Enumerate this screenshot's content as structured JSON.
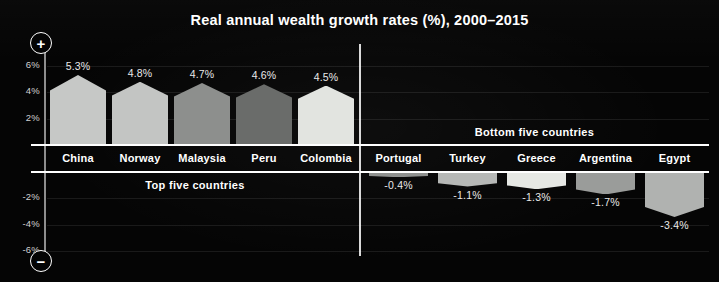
{
  "title": "Real annual wealth growth rates (%), 2000–2015",
  "axis": {
    "plus_icon_label": "+",
    "minus_icon_label": "−",
    "ticks": [
      {
        "label": "6%",
        "value": 6
      },
      {
        "label": "4%",
        "value": 4
      },
      {
        "label": "2%",
        "value": 2
      },
      {
        "label": "-2%",
        "value": -2
      },
      {
        "label": "-4%",
        "value": -4
      },
      {
        "label": "-6%",
        "value": -6
      }
    ]
  },
  "sections": {
    "top_label": "Top five countries",
    "bottom_label": "Bottom five countries"
  },
  "chart_data": {
    "type": "bar",
    "title": "Real annual wealth growth rates (%), 2000–2015",
    "xlabel": "",
    "ylabel": "",
    "ylim": [
      -7,
      7
    ],
    "grid": true,
    "legend": "none",
    "orientation": "vertical",
    "note": "Two panels: five fastest-growing (left, positive) and five fastest-shrinking (right, negative) countries.",
    "panels": [
      {
        "name": "Top five countries",
        "categories": [
          "China",
          "Norway",
          "Malaysia",
          "Peru",
          "Colombia"
        ],
        "values": [
          5.3,
          4.8,
          4.7,
          4.6,
          4.5
        ],
        "value_labels": [
          "5.3%",
          "4.8%",
          "4.7%",
          "4.6%",
          "4.5%"
        ],
        "colors": [
          "#c6c8c6",
          "#c3c5c3",
          "#8d8f8d",
          "#6a6c6a",
          "#e2e4e0"
        ]
      },
      {
        "name": "Bottom five countries",
        "categories": [
          "Portugal",
          "Turkey",
          "Greece",
          "Argentina",
          "Egypt"
        ],
        "values": [
          -0.4,
          -1.1,
          -1.3,
          -1.7,
          -3.4
        ],
        "value_labels": [
          "-0.4%",
          "-1.1%",
          "-1.3%",
          "-1.7%",
          "-3.4%"
        ],
        "colors": [
          "#8f918f",
          "#b6b8b6",
          "#e6e8e4",
          "#9a9c9a",
          "#b0b2b0"
        ]
      }
    ]
  }
}
